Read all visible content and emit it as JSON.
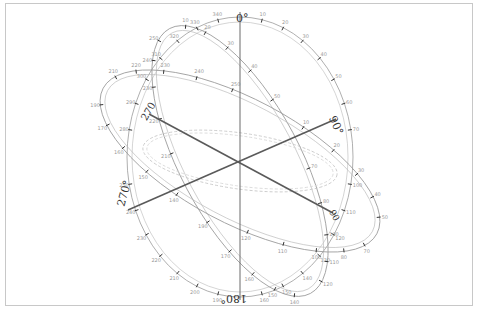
{
  "diagram": {
    "type": "3d-rotation-gizmo",
    "center": [
      240,
      161
    ],
    "colors": {
      "frame": "#c8c8c8",
      "axis": "#5a5a5a",
      "ring": "#9a9a9a",
      "tick": "#333333",
      "label": "#333333"
    },
    "labels": {
      "top": "0°",
      "right": "90°",
      "bottom": "180°",
      "left": "270°"
    },
    "ring_ticks": [
      "10°",
      "20°",
      "30°",
      "40°",
      "50°",
      "60°",
      "70°",
      "80°",
      "100°",
      "110°",
      "120°",
      "130°",
      "140°",
      "150°",
      "160°",
      "170°",
      "190°",
      "200°",
      "210°",
      "220°",
      "230°",
      "240°",
      "250°",
      "260°",
      "280°",
      "290°",
      "300°",
      "310°",
      "320°",
      "330°",
      "340°",
      "350°"
    ]
  }
}
